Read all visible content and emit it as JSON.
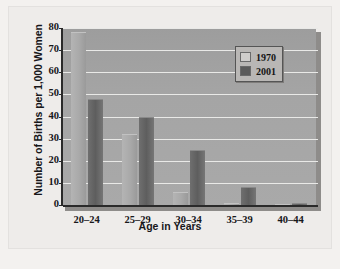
{
  "chart_data": {
    "type": "bar",
    "title": "",
    "xlabel": "Age in Years",
    "ylabel": "Number of Births per 1,000 Women",
    "categories": [
      "20–24",
      "25–29",
      "30–34",
      "35–39",
      "40–44"
    ],
    "series": [
      {
        "name": "1970",
        "values": [
          78,
          32,
          6,
          1,
          0
        ],
        "color": "#a9a9a9"
      },
      {
        "name": "2001",
        "values": [
          48,
          40,
          25,
          8,
          1
        ],
        "color": "#5e5e5e"
      }
    ],
    "ylim": [
      0,
      80
    ],
    "yticks": [
      0,
      10,
      20,
      30,
      40,
      50,
      60,
      70,
      80
    ],
    "ytick_labels": [
      "0",
      "10",
      "20",
      "30",
      "40",
      "50",
      "60",
      "70",
      "80"
    ],
    "grid": true,
    "legend_position": "top-right",
    "plot_background": "#a5a5a5",
    "gridline_color": "#e9e9e7",
    "page_background": "#f3f1ef"
  },
  "legend": {
    "entries": [
      {
        "label": "1970"
      },
      {
        "label": "2001"
      }
    ]
  }
}
